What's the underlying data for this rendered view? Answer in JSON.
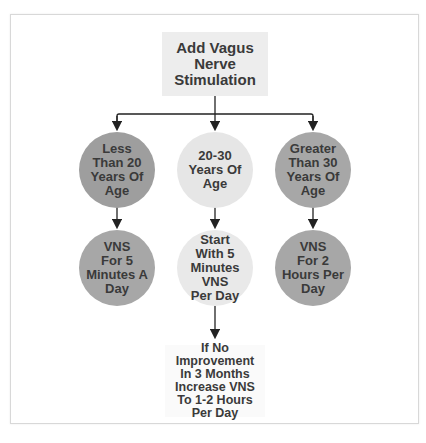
{
  "diagram": {
    "root": {
      "label": "Add Vagus Nerve Stimulation",
      "lines": [
        "Add Vagus",
        "Nerve",
        "Stimulation"
      ]
    },
    "age_groups": [
      {
        "label": "Less Than 20 Years Of Age",
        "lines": [
          "Less",
          "Than 20",
          "Years Of",
          "Age"
        ],
        "color": "#9e9e9e"
      },
      {
        "label": "20-30 Years Of Age",
        "lines": [
          "20-30",
          "Years Of",
          "Age"
        ],
        "color": "#e6e6e6"
      },
      {
        "label": "Greater Than 30 Years Of Age",
        "lines": [
          "Greater",
          "Than 30",
          "Years Of",
          "Age"
        ],
        "color": "#a7a7a7"
      }
    ],
    "recommendations": [
      {
        "label": "VNS For 5 Minutes A Day",
        "lines": [
          "VNS",
          "For 5",
          "Minutes A",
          "Day"
        ],
        "color": "#a5a5a5"
      },
      {
        "label": "Start With 5 Minutes VNS Per Day",
        "lines": [
          "Start",
          "With 5",
          "Minutes VNS",
          "Per Day"
        ],
        "color": "#e9e9e9"
      },
      {
        "label": "VNS For 2 Hours Per Day",
        "lines": [
          "VNS",
          "For 2",
          "Hours Per",
          "Day"
        ],
        "color": "#a5a5a5"
      }
    ],
    "followup": {
      "label": "If No Improvement In 3 Months Increase VNS To 1-2 Hours Per Day",
      "lines": [
        "If No",
        "Improvement",
        "In 3 Months",
        "Increase VNS",
        "To 1-2 Hours",
        "Per Day"
      ]
    }
  }
}
